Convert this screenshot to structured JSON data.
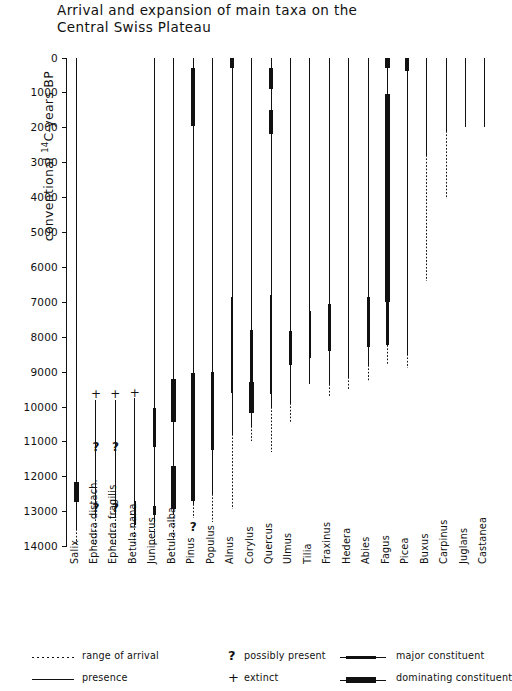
{
  "title": "Arrival and expansion of main taxa on the\nCentral Swiss Plateau",
  "axis": {
    "label_pre": "conventional ",
    "label_sup": "14",
    "label_post": "C-years  BP",
    "ticks": [
      0,
      1000,
      2000,
      3000,
      4000,
      5000,
      6000,
      7000,
      8000,
      9000,
      10000,
      11000,
      12000,
      13000,
      14000
    ]
  },
  "legend": {
    "items": [
      {
        "symbol": "dotted-line",
        "label": "range of arrival"
      },
      {
        "symbol": "question-mark",
        "label": "possibly present"
      },
      {
        "symbol": "major-bar",
        "label": "major constituent"
      },
      {
        "symbol": "solid-line",
        "label": "presence"
      },
      {
        "symbol": "plus-sign",
        "label": "extinct"
      },
      {
        "symbol": "dominating-bar",
        "label": "dominating constituent"
      }
    ]
  },
  "chart_data": {
    "type": "range-bar",
    "title": "Arrival and expansion of main taxa on the Central Swiss Plateau",
    "ylabel": "conventional 14C-years BP",
    "xlabel": "",
    "ylim": [
      0,
      14000
    ],
    "y_inverted": false,
    "grid": false,
    "legend_position": "bottom",
    "segment_types": {
      "arrival": "range of arrival (dotted)",
      "presence": "presence (thin line)",
      "major": "major constituent (thick line)",
      "dominating": "dominating constituent (very thick line)"
    },
    "categories": [
      "Salix",
      "Ephedra distach.",
      "Ephedra fragilis",
      "Betula nana",
      "Juniperus",
      "Betula alba",
      "Pinus",
      "Populus",
      "Alnus",
      "Corylus",
      "Quercus",
      "Ulmus",
      "Tilia",
      "Fraxinus",
      "Hedera",
      "Abies",
      "Fagus",
      "Picea",
      "Buxus",
      "Carpinus",
      "Juglans",
      "Castanea"
    ],
    "taxa": [
      {
        "name": "Salix",
        "segments": [
          {
            "type": "presence",
            "from": 0,
            "to": 13500
          },
          {
            "type": "dominating",
            "from": 12150,
            "to": 12750
          },
          {
            "type": "arrival",
            "from": 13500,
            "to": 14000
          }
        ],
        "markers": []
      },
      {
        "name": "Ephedra distach.",
        "segments": [
          {
            "type": "presence",
            "from": 9800,
            "to": 13150
          },
          {
            "type": "arrival",
            "from": 13150,
            "to": 14000
          }
        ],
        "markers": [
          {
            "symbol": "+",
            "at": 9650
          },
          {
            "symbol": "?",
            "at": 11150
          },
          {
            "symbol": "?",
            "at": 12900
          }
        ]
      },
      {
        "name": "Ephedra fragilis",
        "segments": [
          {
            "type": "presence",
            "from": 9800,
            "to": 13150
          },
          {
            "type": "arrival",
            "from": 13150,
            "to": 14000
          }
        ],
        "markers": [
          {
            "symbol": "+",
            "at": 9650
          },
          {
            "symbol": "?",
            "at": 11150
          },
          {
            "symbol": "?",
            "at": 12900
          }
        ]
      },
      {
        "name": "Betula nana",
        "segments": [
          {
            "type": "presence",
            "from": 9750,
            "to": 13400
          },
          {
            "type": "major",
            "from": 12700,
            "to": 13400
          },
          {
            "type": "arrival",
            "from": 13400,
            "to": 14000
          }
        ],
        "markers": [
          {
            "symbol": "+",
            "at": 9600
          }
        ]
      },
      {
        "name": "Juniperus",
        "segments": [
          {
            "type": "presence",
            "from": 0,
            "to": 13300
          },
          {
            "type": "major",
            "from": 10050,
            "to": 11150
          },
          {
            "type": "major",
            "from": 12850,
            "to": 13100
          },
          {
            "type": "arrival",
            "from": 13300,
            "to": 14000
          }
        ],
        "markers": []
      },
      {
        "name": "Betula alba",
        "segments": [
          {
            "type": "presence",
            "from": 0,
            "to": 13050
          },
          {
            "type": "dominating",
            "from": 9200,
            "to": 10450
          },
          {
            "type": "dominating",
            "from": 11700,
            "to": 12950
          },
          {
            "type": "arrival",
            "from": 13050,
            "to": 13800
          }
        ],
        "markers": []
      },
      {
        "name": "Pinus",
        "segments": [
          {
            "type": "presence",
            "from": 0,
            "to": 12800
          },
          {
            "type": "dominating",
            "from": 300,
            "to": 1950
          },
          {
            "type": "dominating",
            "from": 9050,
            "to": 12700
          },
          {
            "type": "arrival",
            "from": 12800,
            "to": 13200
          }
        ],
        "markers": [
          {
            "symbol": "?",
            "at": 13450
          }
        ]
      },
      {
        "name": "Populus",
        "segments": [
          {
            "type": "presence",
            "from": 0,
            "to": 12500
          },
          {
            "type": "major",
            "from": 9000,
            "to": 11250
          },
          {
            "type": "arrival",
            "from": 12500,
            "to": 13300
          }
        ],
        "markers": []
      },
      {
        "name": "Alnus",
        "segments": [
          {
            "type": "presence",
            "from": 0,
            "to": 10800
          },
          {
            "type": "dominating",
            "from": 0,
            "to": 300
          },
          {
            "type": "major",
            "from": 6850,
            "to": 9600
          },
          {
            "type": "arrival",
            "from": 10800,
            "to": 12950
          }
        ],
        "markers": []
      },
      {
        "name": "Corylus",
        "segments": [
          {
            "type": "presence",
            "from": 0,
            "to": 10550
          },
          {
            "type": "major",
            "from": 7800,
            "to": 9300
          },
          {
            "type": "dominating",
            "from": 9300,
            "to": 10200
          },
          {
            "type": "arrival",
            "from": 10550,
            "to": 11000
          }
        ],
        "markers": []
      },
      {
        "name": "Quercus",
        "segments": [
          {
            "type": "presence",
            "from": 0,
            "to": 10000
          },
          {
            "type": "dominating",
            "from": 300,
            "to": 900
          },
          {
            "type": "dominating",
            "from": 1500,
            "to": 2200
          },
          {
            "type": "major",
            "from": 6800,
            "to": 9650
          },
          {
            "type": "arrival",
            "from": 10000,
            "to": 11300
          }
        ],
        "markers": []
      },
      {
        "name": "Ulmus",
        "segments": [
          {
            "type": "presence",
            "from": 0,
            "to": 9900
          },
          {
            "type": "major",
            "from": 7850,
            "to": 8800
          },
          {
            "type": "arrival",
            "from": 9900,
            "to": 10450
          }
        ],
        "markers": []
      },
      {
        "name": "Tilia",
        "segments": [
          {
            "type": "presence",
            "from": 0,
            "to": 9350
          },
          {
            "type": "major",
            "from": 7250,
            "to": 8600
          }
        ],
        "markers": []
      },
      {
        "name": "Fraxinus",
        "segments": [
          {
            "type": "presence",
            "from": 0,
            "to": 9350
          },
          {
            "type": "major",
            "from": 7050,
            "to": 8400
          },
          {
            "type": "arrival",
            "from": 9350,
            "to": 9700
          }
        ],
        "markers": []
      },
      {
        "name": "Hedera",
        "segments": [
          {
            "type": "presence",
            "from": 0,
            "to": 9150
          },
          {
            "type": "arrival",
            "from": 9150,
            "to": 9500
          }
        ],
        "markers": []
      },
      {
        "name": "Abies",
        "segments": [
          {
            "type": "presence",
            "from": 0,
            "to": 8800
          },
          {
            "type": "major",
            "from": 6850,
            "to": 8300
          },
          {
            "type": "arrival",
            "from": 8800,
            "to": 9300
          }
        ],
        "markers": []
      },
      {
        "name": "Fagus",
        "segments": [
          {
            "type": "presence",
            "from": 0,
            "to": 8250
          },
          {
            "type": "dominating",
            "from": 0,
            "to": 300
          },
          {
            "type": "dominating",
            "from": 1050,
            "to": 7000
          },
          {
            "type": "major",
            "from": 7000,
            "to": 8250
          },
          {
            "type": "arrival",
            "from": 8250,
            "to": 8800
          }
        ],
        "markers": []
      },
      {
        "name": "Picea",
        "segments": [
          {
            "type": "presence",
            "from": 0,
            "to": 8500
          },
          {
            "type": "dominating",
            "from": 0,
            "to": 400
          },
          {
            "type": "arrival",
            "from": 8500,
            "to": 8900
          }
        ],
        "markers": []
      },
      {
        "name": "Buxus",
        "segments": [
          {
            "type": "presence",
            "from": 0,
            "to": 2800
          },
          {
            "type": "arrival",
            "from": 2800,
            "to": 6400
          }
        ],
        "markers": []
      },
      {
        "name": "Carpinus",
        "segments": [
          {
            "type": "presence",
            "from": 0,
            "to": 2100
          },
          {
            "type": "arrival",
            "from": 2100,
            "to": 4050
          }
        ],
        "markers": []
      },
      {
        "name": "Juglans",
        "segments": [
          {
            "type": "presence",
            "from": 0,
            "to": 2000
          }
        ],
        "markers": []
      },
      {
        "name": "Castanea",
        "segments": [
          {
            "type": "presence",
            "from": 0,
            "to": 2000
          }
        ],
        "markers": []
      }
    ]
  }
}
